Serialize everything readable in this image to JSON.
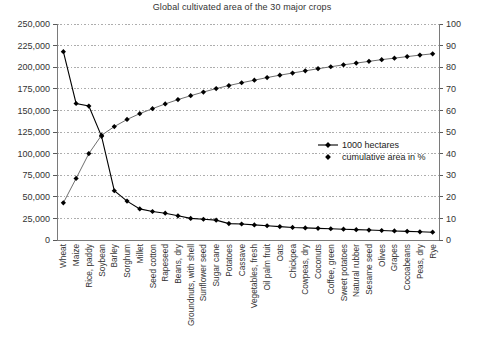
{
  "chart_data": {
    "type": "line",
    "title": "Global cultivated area of the 30 major crops",
    "xlabel": "",
    "ylabel": "",
    "y2label": "",
    "ylim": [
      0,
      250000
    ],
    "y2lim": [
      0,
      100
    ],
    "grid": true,
    "legend_position": "center-right",
    "categories": [
      "Wheat",
      "Maize",
      "Rice, paddy",
      "Soybean",
      "Barley",
      "Sorghum",
      "Millet",
      "Seed cotton",
      "Rapeseed",
      "Beans, dry",
      "Groundnuts, with shell",
      "Sunflower seed",
      "Sugar cane",
      "Potatoes",
      "Cassave",
      "Vegetables, fresh",
      "Oil palm fruit",
      "Oats",
      "Chickpea",
      "Cowpeas, dry",
      "Coconuts",
      "Coffee, green",
      "Sweet potatoes",
      "Natural rubber",
      "Sesame seed",
      "Olives",
      "Grapes",
      "Cocoabeans",
      "Peas, dry",
      "Rye"
    ],
    "y_ticks_left": [
      "0",
      "25,000",
      "50,000",
      "75,000",
      "100,000",
      "125,000",
      "150,000",
      "175,000",
      "200,000",
      "225,000",
      "250,000"
    ],
    "y_ticks_right": [
      "0",
      "10",
      "20",
      "30",
      "40",
      "50",
      "60",
      "70",
      "80",
      "90",
      "100"
    ],
    "series": [
      {
        "name": "1000 hectares",
        "axis": "left",
        "marker": "diamond",
        "color": "#000000",
        "values": [
          218000,
          158000,
          155000,
          120000,
          57000,
          45000,
          36000,
          33000,
          31000,
          28000,
          25000,
          24000,
          23000,
          19000,
          18500,
          17500,
          16500,
          15500,
          14500,
          14000,
          13500,
          13000,
          12500,
          12000,
          11500,
          11000,
          10500,
          10000,
          9500,
          9000
        ]
      },
      {
        "name": "cumulative area in %",
        "axis": "right",
        "marker": "diamond",
        "color": "#000000",
        "values": [
          17.2,
          28.5,
          40.0,
          48.5,
          52.5,
          55.8,
          58.5,
          60.8,
          63.0,
          65.0,
          66.8,
          68.5,
          70.1,
          71.5,
          72.8,
          74.0,
          75.2,
          76.3,
          77.3,
          78.3,
          79.3,
          80.2,
          81.1,
          81.9,
          82.7,
          83.5,
          84.2,
          84.9,
          85.6,
          86.2
        ]
      }
    ]
  },
  "legend": {
    "entries": [
      {
        "label": "1000 hectares"
      },
      {
        "label": "cumulative area in %"
      }
    ]
  }
}
